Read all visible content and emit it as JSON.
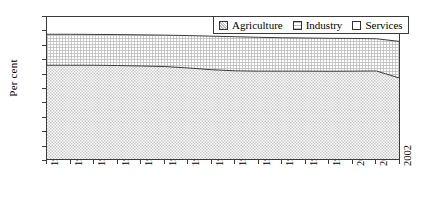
{
  "chart_data": {
    "type": "area",
    "stacked": true,
    "title": "",
    "xlabel": "",
    "ylabel": "Per cent",
    "ylim": [
      0,
      100
    ],
    "yticks": [
      0,
      10,
      20,
      30,
      40,
      50,
      60,
      70,
      80,
      90,
      100
    ],
    "grid": false,
    "legend_position": "top-right",
    "categories": [
      "1987",
      "1988",
      "1989",
      "1990",
      "1991",
      "1992",
      "1993",
      "1994",
      "1995",
      "1996",
      "1997",
      "1998",
      "1999",
      "2000",
      "2001",
      "2002"
    ],
    "series": [
      {
        "name": "Agriculture",
        "pattern": "dense-crosshatch",
        "values": [
          66.5,
          66.5,
          66.5,
          66.3,
          66.0,
          65.6,
          64.6,
          63.4,
          62.6,
          62.4,
          62.4,
          62.4,
          62.3,
          62.4,
          62.5,
          57.5
        ]
      },
      {
        "name": "Industry",
        "pattern": "fine-grid",
        "values": [
          21.5,
          21.5,
          21.4,
          21.5,
          21.6,
          21.8,
          22.5,
          23.3,
          23.7,
          23.5,
          23.2,
          23.0,
          22.9,
          22.7,
          22.4,
          25.5
        ]
      },
      {
        "name": "Services",
        "pattern": "none",
        "values": [
          12.0,
          12.0,
          12.1,
          12.2,
          12.4,
          12.6,
          12.9,
          13.3,
          13.7,
          14.1,
          14.4,
          14.6,
          14.8,
          14.9,
          15.1,
          17.0
        ]
      }
    ],
    "cumulative_upper_agriculture": [
      66.5,
      66.5,
      66.5,
      66.3,
      66.0,
      65.6,
      64.6,
      63.4,
      62.6,
      62.4,
      62.4,
      62.4,
      62.3,
      62.4,
      62.5,
      57.5
    ],
    "cumulative_upper_industry": [
      88.0,
      88.0,
      87.9,
      87.8,
      87.6,
      87.4,
      87.1,
      86.7,
      86.3,
      85.9,
      85.6,
      85.4,
      85.2,
      85.1,
      84.9,
      83.0
    ]
  },
  "legend": {
    "items": [
      {
        "label": "Agriculture",
        "swatch": "agriculture-swatch"
      },
      {
        "label": "Industry",
        "swatch": "industry-swatch"
      },
      {
        "label": "Services",
        "swatch": "services-swatch"
      }
    ]
  }
}
